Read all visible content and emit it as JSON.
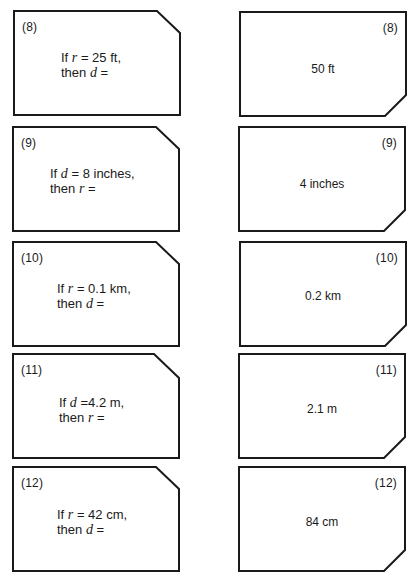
{
  "cards": [
    {
      "number": "(8)",
      "question": {
        "line1_prefix": "If ",
        "given_var": "r",
        "line1_suffix": " = 25 ft,",
        "line2_prefix": "then ",
        "find_var": "d",
        "line2_suffix": " ="
      },
      "answer": "50 ft"
    },
    {
      "number": "(9)",
      "question": {
        "line1_prefix": "If ",
        "given_var": "d",
        "line1_suffix": " = 8 inches,",
        "line2_prefix": "then ",
        "find_var": "r",
        "line2_suffix": " ="
      },
      "answer": "4 inches"
    },
    {
      "number": "(10)",
      "question": {
        "line1_prefix": "If ",
        "given_var": "r",
        "line1_suffix": " = 0.1 km,",
        "line2_prefix": "then ",
        "find_var": "d",
        "line2_suffix": " ="
      },
      "answer": "0.2 km"
    },
    {
      "number": "(11)",
      "question": {
        "line1_prefix": "If ",
        "given_var": "d",
        "line1_suffix": " =4.2 m,",
        "line2_prefix": "then ",
        "find_var": "r",
        "line2_suffix": " ="
      },
      "answer": "2.1 m"
    },
    {
      "number": "(12)",
      "question": {
        "line1_prefix": "If ",
        "given_var": "r",
        "line1_suffix": " = 42 cm,",
        "line2_prefix": "then ",
        "find_var": "d",
        "line2_suffix": " ="
      },
      "answer": "84 cm"
    }
  ],
  "style": {
    "border_color": "#1a1a1a",
    "background": "#ffffff"
  }
}
